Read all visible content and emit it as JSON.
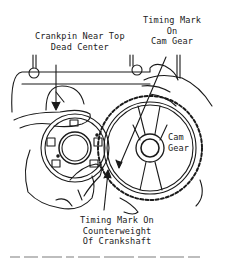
{
  "figure": {
    "type": "technical line drawing",
    "labels": {
      "crankpin": [
        "Crankpin Near Top",
        "Dead Center"
      ],
      "cam_timing_mark": [
        "Timing Mark",
        "On",
        "Cam Gear"
      ],
      "cam_gear": [
        "Cam",
        "Gear"
      ],
      "crank_timing_mark": [
        "Timing Mark On",
        "Counterweight",
        "Of Crankshaft"
      ]
    },
    "caption": "(illegible, cropped)",
    "colors": {
      "ink": "#1a1a1a",
      "background": "#ffffff"
    }
  }
}
